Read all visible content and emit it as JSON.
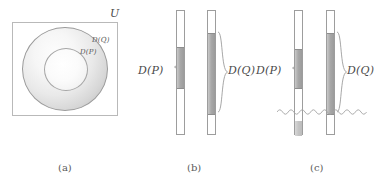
{
  "figure": {
    "background_color": "#ffffff",
    "stroke_color": "#9d9d9d",
    "fill_dark": "#a8a8a8",
    "fill_light": "#c4c4c4",
    "text_color": "#4a4a4a"
  },
  "panels": [
    {
      "id": "a",
      "caption": "(a)",
      "type": "venn-annulus",
      "universe_label": "U",
      "labels": {
        "outer": "D(Q)",
        "inner": "D(P)"
      }
    },
    {
      "id": "b",
      "caption": "(b)",
      "type": "interval-bars",
      "bars": [
        {
          "name": "D(P)",
          "label": "D(P)",
          "label_side": "left"
        },
        {
          "name": "D(Q)",
          "label": "D(Q)",
          "label_side": "right"
        }
      ]
    },
    {
      "id": "c",
      "caption": "(c)",
      "type": "interval-bars-with-cut",
      "bars": [
        {
          "name": "D(P)",
          "label": "D(P)",
          "label_side": "left"
        },
        {
          "name": "D(Q)",
          "label": "D(Q)",
          "label_side": "right"
        }
      ],
      "cut_marker": "wavy-line"
    }
  ],
  "captions": {
    "a": "(a)",
    "b": "(b)",
    "c": "(c)"
  },
  "math_labels": {
    "universe": "U",
    "dp": "D(P)",
    "dq": "D(Q)"
  }
}
